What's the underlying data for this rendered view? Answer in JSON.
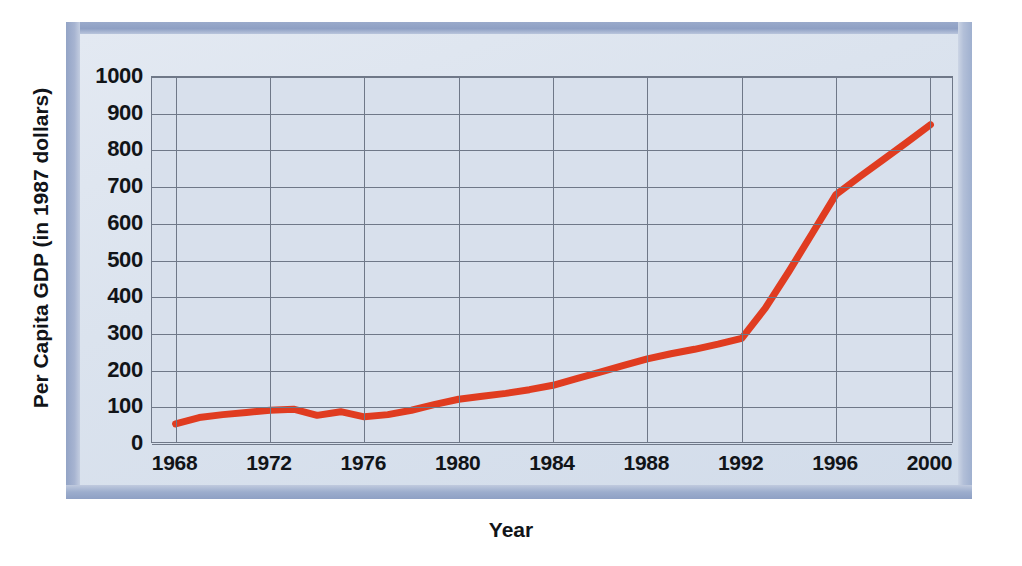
{
  "chart_data": {
    "type": "line",
    "title": "",
    "xlabel": "Year",
    "ylabel": "Per Capita GDP (in 1987 dollars)",
    "xlim": [
      1967,
      2001
    ],
    "ylim": [
      0,
      1000
    ],
    "grid": true,
    "legend": "none",
    "line_color": "#e03c20",
    "x": [
      1968,
      1969,
      1970,
      1971,
      1972,
      1973,
      1974,
      1975,
      1976,
      1977,
      1978,
      1979,
      1980,
      1981,
      1982,
      1983,
      1984,
      1985,
      1986,
      1987,
      1988,
      1989,
      1990,
      1991,
      1992,
      1993,
      1994,
      1995,
      1996,
      1997,
      1998,
      1999,
      2000
    ],
    "y": [
      55,
      72,
      80,
      86,
      92,
      95,
      78,
      88,
      74,
      80,
      92,
      108,
      122,
      130,
      138,
      148,
      160,
      178,
      196,
      214,
      232,
      246,
      258,
      272,
      288,
      370,
      470,
      575,
      680,
      728,
      775,
      822,
      870
    ],
    "x_ticks": [
      1968,
      1972,
      1976,
      1980,
      1984,
      1988,
      1992,
      1996,
      2000
    ],
    "x_tick_labels": [
      "1968",
      "1972",
      "1976",
      "1980",
      "1984",
      "1988",
      "1992",
      "1996",
      "2000"
    ],
    "y_ticks": [
      0,
      100,
      200,
      300,
      400,
      500,
      600,
      700,
      800,
      900,
      1000
    ],
    "y_tick_labels": [
      "0",
      "100",
      "200",
      "300",
      "400",
      "500",
      "600",
      "700",
      "800",
      "900",
      "1000"
    ],
    "grid_x": [
      1968,
      1972,
      1976,
      1980,
      1984,
      1988,
      1992,
      1996,
      2000
    ],
    "grid_y": [
      0,
      100,
      200,
      300,
      400,
      500,
      600,
      700,
      800,
      900,
      1000
    ],
    "notable_values": {
      "start_year": 1968,
      "start_value": 55,
      "end_year": 2000,
      "end_value": 870,
      "inflection_year": 1992,
      "inflection_value": 288,
      "mid_1996_value": 680
    }
  },
  "colors": {
    "line": "#e03c20",
    "grid": "#6f7878",
    "plot_background": "#d8e0ec",
    "panel_background": "#dee5f0",
    "frame": "#9aaacb",
    "text": "#111418"
  }
}
